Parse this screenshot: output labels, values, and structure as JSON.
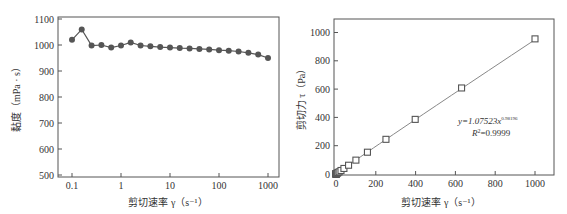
{
  "chart_data": [
    {
      "type": "line",
      "title": "",
      "xlabel": "剪切速率 γ ( s⁻¹ )",
      "ylabel": "黏度 ( mPa · s )",
      "xscale": "log",
      "xlim": [
        0.05,
        1500
      ],
      "ylim": [
        500,
        1100
      ],
      "xticks": [
        "0.1",
        "1",
        "10",
        "100",
        "1000"
      ],
      "yticks": [
        "500",
        "600",
        "700",
        "800",
        "900",
        "1000",
        "1100"
      ],
      "grid": false,
      "legend": null,
      "series": [
        {
          "name": "viscosity",
          "marker": "filled-circle",
          "x": [
            0.1,
            0.158,
            0.251,
            0.398,
            0.631,
            1,
            1.58,
            2.51,
            3.98,
            6.31,
            10,
            15.8,
            25.1,
            39.8,
            63.1,
            100,
            158,
            251,
            398,
            631,
            1000
          ],
          "values": [
            1020,
            1060,
            998,
            1000,
            990,
            998,
            1010,
            998,
            995,
            992,
            990,
            988,
            987,
            985,
            983,
            980,
            978,
            975,
            970,
            963,
            950
          ]
        }
      ]
    },
    {
      "type": "scatter",
      "title": "",
      "xlabel": "剪切速率 γ ( s⁻¹ )",
      "ylabel": "剪切力 τ ( Pa )",
      "xlim": [
        -5,
        1100
      ],
      "ylim": [
        -5,
        1100
      ],
      "xticks": [
        "0",
        "200",
        "400",
        "600",
        "800",
        "1000"
      ],
      "yticks": [
        "0",
        "200",
        "400",
        "600",
        "800",
        "1000"
      ],
      "grid": false,
      "legend": null,
      "annotations": [
        "y=1.07523x^0.98196",
        "R²=0.9999"
      ],
      "series": [
        {
          "name": "shear stress",
          "marker": "open-square",
          "x": [
            0.1,
            0.158,
            0.251,
            0.398,
            0.631,
            1,
            1.58,
            2.51,
            3.98,
            6.31,
            10,
            15.8,
            25.1,
            39.8,
            63.1,
            100,
            158,
            251,
            398,
            631,
            1000
          ],
          "values": [
            0.1,
            0.17,
            0.25,
            0.4,
            0.62,
            1.0,
            1.6,
            2.5,
            4.0,
            6.3,
            9.9,
            15.6,
            24.8,
            39.2,
            61.9,
            98,
            154,
            245,
            386,
            608,
            955
          ]
        },
        {
          "name": "power-law fit",
          "type": "line",
          "equation": "y=1.07523x^0.98196"
        }
      ]
    }
  ],
  "left": {
    "ylabel": "黏度（mPa · s）",
    "xlabel": "剪切速率 γ（s⁻¹）",
    "yticks": [
      "1100",
      "1000",
      "900",
      "800",
      "700",
      "600",
      "500"
    ],
    "xticks": [
      "0.1",
      "1",
      "10",
      "100",
      "1000"
    ]
  },
  "right": {
    "ylabel": "剪切力 τ（Pa）",
    "xlabel": "剪切速率 γ（s⁻¹）",
    "yticks": [
      "1000",
      "800",
      "600",
      "400",
      "200",
      "0"
    ],
    "xticks": [
      "0",
      "200",
      "400",
      "600",
      "800",
      "1000"
    ],
    "equation_prefix": "y=1.07523x",
    "equation_exp": "0.98196",
    "r2_prefix": "R",
    "r2_sup": "2",
    "r2_value": "=0.9999"
  },
  "colors": {
    "axis": "#555555",
    "marker": "#555555",
    "line": "#888888"
  }
}
